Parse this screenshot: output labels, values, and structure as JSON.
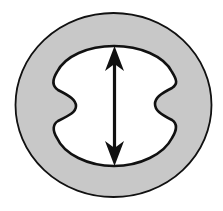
{
  "diagram": {
    "colors": {
      "background": "#ffffff",
      "ring_fill": "#c8c8c8",
      "cavity_fill": "#ffffff",
      "stroke": "#111111"
    },
    "elements": [
      {
        "id": "outer-ring",
        "type": "ellipse",
        "fill": "gray"
      },
      {
        "id": "inner-cavity",
        "type": "notched-ellipse",
        "fill": "white",
        "notches": [
          "left",
          "right"
        ]
      },
      {
        "id": "vertical-arrow",
        "type": "double-headed-arrow",
        "orientation": "vertical"
      }
    ]
  }
}
